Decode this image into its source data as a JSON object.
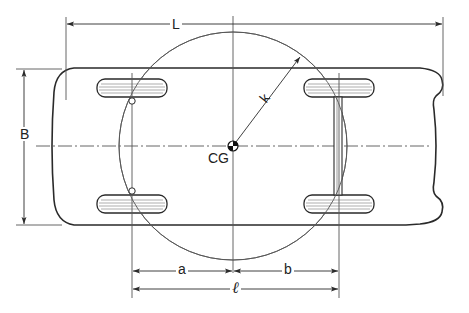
{
  "diagram": {
    "colors": {
      "line": "#2a2a2a",
      "thin": "#555555",
      "background": "#ffffff"
    },
    "labels": {
      "length": "L",
      "width": "B",
      "radius_of_gyration": "k",
      "center_of_gravity": "CG",
      "front_to_cg": "a",
      "cg_to_rear": "b",
      "wheelbase": "ℓ"
    }
  }
}
